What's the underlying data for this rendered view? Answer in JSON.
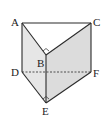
{
  "figure": {
    "type": "triangular-prism",
    "labels": {
      "A": "A",
      "B": "B",
      "C": "C",
      "D": "D",
      "E": "E",
      "F": "F"
    },
    "colors": {
      "stroke": "#2a2a2a",
      "face_shade": "#e2e2e2",
      "face_light": "#efefef",
      "top_face": "#ffffff"
    },
    "right_angle_marks": [
      "B",
      "E"
    ],
    "hidden_edge": "DF"
  }
}
